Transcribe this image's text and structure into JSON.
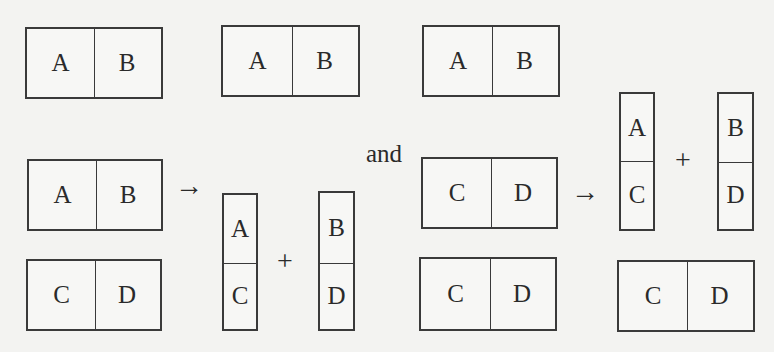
{
  "diagram": {
    "connector_word": "and",
    "arrow_symbol": "→",
    "plus_symbol": "+",
    "line_color": "#3a3a3a",
    "background_color": "#f3f3f1",
    "top_row": [
      {
        "id": "ab-1",
        "left": "A",
        "right": "B"
      },
      {
        "id": "ab-2",
        "left": "A",
        "right": "B"
      },
      {
        "id": "ab-3",
        "left": "A",
        "right": "B"
      }
    ],
    "left_group": {
      "inputs": [
        {
          "id": "ab-input",
          "left": "A",
          "right": "B"
        },
        {
          "id": "cd-input",
          "left": "C",
          "right": "D"
        }
      ],
      "outputs": [
        {
          "id": "ac-column",
          "top": "A",
          "bottom": "C"
        },
        {
          "id": "bd-column",
          "top": "B",
          "bottom": "D"
        }
      ]
    },
    "right_group": {
      "inputs": [
        {
          "id": "cd-input-mid",
          "left": "C",
          "right": "D"
        }
      ],
      "outputs": [
        {
          "id": "ac-column-right",
          "top": "A",
          "bottom": "C"
        },
        {
          "id": "bd-column-right",
          "top": "B",
          "bottom": "D"
        }
      ]
    },
    "bottom_row": [
      {
        "id": "cd-bottom-1",
        "left": "C",
        "right": "D"
      },
      {
        "id": "cd-bottom-2",
        "left": "C",
        "right": "D"
      }
    ]
  }
}
